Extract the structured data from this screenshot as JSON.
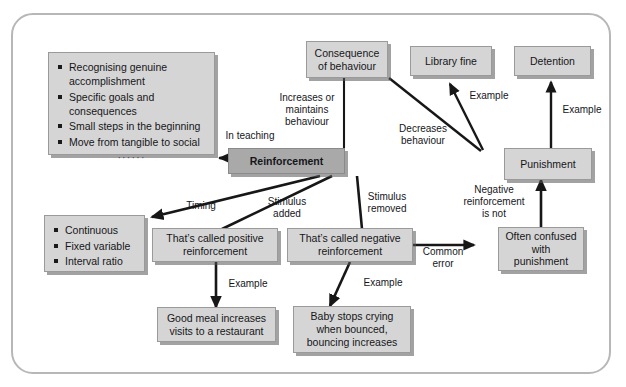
{
  "diagram": {
    "frame_color": "#b7b7b7",
    "node_fill": "#d5d5d5",
    "node_fill_highlight": "#a9a9a9",
    "nodes": {
      "teaching_tips": {
        "items": [
          "Recognising genuine accomplishment",
          "Specific goals and consequences",
          "Small steps in the beginning",
          "Move from tangible to social"
        ],
        "ellipsis": "······"
      },
      "schedules": {
        "items": [
          "Continuous",
          "Fixed variable",
          "Interval ratio"
        ]
      },
      "consequence": "Consequence\nof behaviour",
      "library_fine": "Library fine",
      "detention": "Detention",
      "reinforcement": "Reinforcement",
      "punishment": "Punishment",
      "positive": "That’s called positive\nreinforcement",
      "negative": "That’s called negative\nreinforcement",
      "confused": "Often confused\nwith\npunishment",
      "good_meal": "Good meal increases\nvisits to a restaurant",
      "baby": "Baby stops crying\nwhen bounced,\nbouncing increases"
    },
    "edge_labels": {
      "in_teaching": "In teaching",
      "increases": "Increases or\nmaintains\nbehaviour",
      "decreases": "Decreases\nbehaviour",
      "example_library": "Example",
      "example_detention": "Example",
      "negative_is_not": "Negative\nreinforcement\nis not",
      "common_error": "Common\nerror",
      "timing": "Timing",
      "stimulus_added": "Stimulus\nadded",
      "stimulus_removed": "Stimulus\nremoved",
      "example_positive": "Example",
      "example_negative": "Example"
    }
  }
}
